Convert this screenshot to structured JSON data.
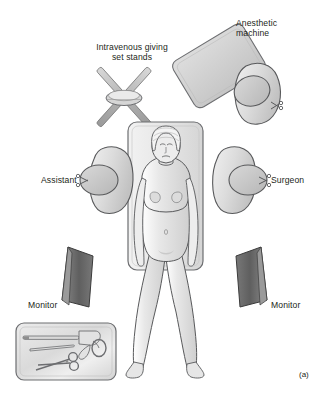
{
  "figure": {
    "caption": "(a)",
    "title_context": "Operating theatre layout for laparoscopic surgery",
    "background_color": "#ffffff",
    "line_color": "#231f20"
  },
  "labels": {
    "anesthetic_machine": "Anesthetic\nmachine",
    "iv_stands": "Intravenous giving\nset stands",
    "assistant": "Assistant",
    "surgeon": "Surgeon",
    "monitor_left": "Monitor",
    "monitor_right": "Monitor"
  },
  "elements": {
    "operating_table": {
      "name": "operating-table",
      "fill": "#e9e9e9",
      "stroke": "#6d6e71"
    },
    "patient": {
      "name": "patient",
      "fill": "#e3e3e3",
      "stroke": "#58595b",
      "headwear": "surgical-cap",
      "position": "supine"
    },
    "anesthetic_machine": {
      "name": "anesthetic-machine",
      "fill": "#d3d3d3",
      "stroke": "#6d6e71",
      "shape": "rotated-rounded-rectangle"
    },
    "iv_stands": {
      "name": "intravenous-giving-set-stands",
      "fill": "#c9c9c9",
      "stroke": "#6d6e71",
      "shape": "crossed-poles-with-hub",
      "pole_count": 4
    },
    "anesthetist": {
      "name": "anesthetist-figure",
      "fill": "#dcdcdc",
      "head_fill": "#c4c4c4",
      "stroke": "#58595b"
    },
    "assistant": {
      "name": "assistant-figure",
      "fill": "#dcdcdc",
      "head_fill": "#c4c4c4",
      "stroke": "#58595b"
    },
    "surgeon": {
      "name": "surgeon-figure",
      "fill": "#dcdcdc",
      "head_fill": "#c4c4c4",
      "stroke": "#58595b"
    },
    "monitor_left": {
      "name": "monitor-left",
      "fill": "#6b6b6b",
      "stroke": "#333333",
      "shape": "angled-screen"
    },
    "monitor_right": {
      "name": "monitor-right",
      "fill": "#6b6b6b",
      "stroke": "#333333",
      "shape": "angled-screen"
    },
    "instrument_tray": {
      "name": "instrument-tray",
      "fill": "#e0e0e0",
      "stroke": "#6d6e71",
      "instruments": [
        "laparoscope",
        "dissector",
        "scissors",
        "grasper-handle"
      ]
    }
  }
}
